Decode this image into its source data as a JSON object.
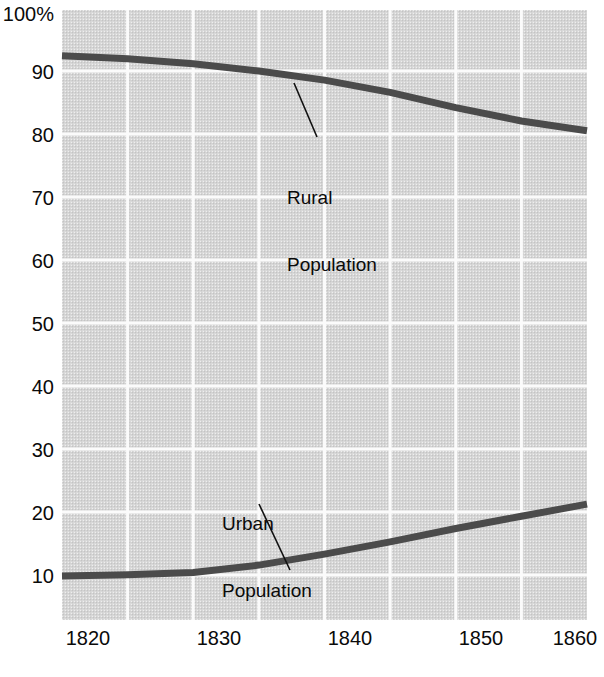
{
  "chart_data": {
    "type": "line",
    "title": "",
    "subtitle": "",
    "xlabel": "",
    "ylabel": "",
    "xlim": [
      1820,
      1860
    ],
    "ylim": [
      0,
      100
    ],
    "grid": true,
    "legend_position": "inline-annotations",
    "x_ticks": [
      "1820",
      "1830",
      "1840",
      "1850",
      "1860"
    ],
    "x_tick_values": [
      1820,
      1830,
      1840,
      1850,
      1860
    ],
    "x_gridline_values": [
      1820,
      1825,
      1830,
      1835,
      1840,
      1845,
      1850,
      1855,
      1860
    ],
    "y_ticks": [
      "100%",
      "90",
      "80",
      "70",
      "60",
      "50",
      "40",
      "30",
      "20",
      "10"
    ],
    "y_tick_values": [
      100,
      90,
      80,
      70,
      60,
      50,
      40,
      30,
      20,
      10
    ],
    "y_gridline_values": [
      90,
      80,
      70,
      60,
      50,
      40,
      30,
      20,
      10
    ],
    "x": [
      1820,
      1825,
      1830,
      1835,
      1840,
      1845,
      1850,
      1855,
      1860
    ],
    "series": [
      {
        "name": "Rural Population",
        "label_text": "Rural\nPopulation",
        "color": "#4b4b4b",
        "values": [
          92.5,
          92.0,
          91.2,
          90.0,
          88.5,
          86.5,
          84.0,
          81.8,
          80.2
        ]
      },
      {
        "name": "Urban Population",
        "label_text": "Urban\nPopulation",
        "color": "#4b4b4b",
        "values": [
          7.2,
          7.4,
          7.8,
          9.0,
          10.8,
          12.8,
          15.0,
          17.0,
          19.0
        ]
      }
    ],
    "annotations": [
      {
        "name": "rural-annotation",
        "line1": "Rural",
        "line2": "Population"
      },
      {
        "name": "urban-annotation",
        "line1": "Urban",
        "line2": "Population"
      }
    ],
    "colors": {
      "plot_background": "#d9d9d9",
      "gridline": "#fbfbfb",
      "line": "#4b4b4b",
      "text": "#0a0a0a",
      "page_background": "#ffffff"
    }
  }
}
